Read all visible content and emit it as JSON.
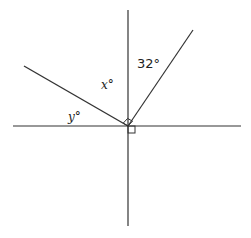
{
  "diagram": {
    "type": "geometry-angles",
    "origin": [
      128,
      126
    ],
    "lines": [
      {
        "name": "vertical-line",
        "x1": 128,
        "y1": 10,
        "x2": 128,
        "y2": 226
      },
      {
        "name": "horizontal-line",
        "x1": 13,
        "y1": 126,
        "x2": 241,
        "y2": 126
      },
      {
        "name": "left-ray",
        "x1": 24,
        "y1": 66,
        "x2": 128,
        "y2": 126
      },
      {
        "name": "right-ray",
        "x1": 128,
        "y1": 126,
        "x2": 193,
        "y2": 30
      }
    ],
    "labels": {
      "angle_32": "32°",
      "angle_x": "x°",
      "angle_y": "y°"
    },
    "right_angle_markers": [
      {
        "name": "right-angle-marker-between-rays",
        "note": "between left ray and right ray"
      },
      {
        "name": "right-angle-marker-axes",
        "note": "lower-right of intersection"
      }
    ],
    "stroke_color": "#333333"
  }
}
